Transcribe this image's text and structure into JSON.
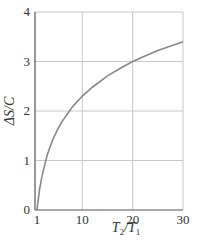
{
  "chart_data": {
    "type": "line",
    "title": "",
    "xlabel": "T2/T1",
    "ylabel": "ΔS/C",
    "xlim": [
      1,
      30
    ],
    "ylim": [
      0,
      4
    ],
    "grid": true,
    "legend": null,
    "x_ticks": [
      "1",
      "10",
      "20",
      "30"
    ],
    "y_ticks": [
      "0",
      "1",
      "2",
      "3",
      "4"
    ],
    "series": [
      {
        "name": "ΔS/C = ln(T2/T1)",
        "x": [
          1,
          1.5,
          2,
          3,
          4,
          5,
          6,
          8,
          10,
          12,
          15,
          18,
          20,
          22,
          25,
          28,
          30
        ],
        "values": [
          0,
          0.41,
          0.69,
          1.1,
          1.39,
          1.61,
          1.79,
          2.08,
          2.3,
          2.48,
          2.71,
          2.89,
          3.0,
          3.09,
          3.22,
          3.33,
          3.4
        ]
      }
    ],
    "colors": {
      "curve": "#888888",
      "grid": "#c8c8c8",
      "axis": "#555555"
    }
  },
  "labels": {
    "xlabel_main": "T",
    "xlabel_sub1": "2",
    "xlabel_slash": "/T",
    "xlabel_sub2": "1",
    "ylabel": "ΔS/C"
  }
}
